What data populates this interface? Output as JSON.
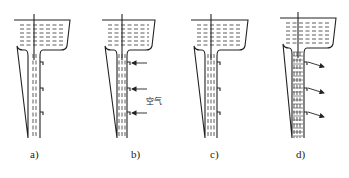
{
  "figure": {
    "panels": [
      {
        "id": "a",
        "label": "a)",
        "flow": "jet-contracted",
        "arrows": "none"
      },
      {
        "id": "b",
        "label": "b)",
        "flow": "aerated-suction",
        "arrows": "inward",
        "arrow_label": "空气"
      },
      {
        "id": "c",
        "label": "c)",
        "flow": "full-pipe",
        "arrows": "none"
      },
      {
        "id": "d",
        "label": "d)",
        "flow": "pressurized",
        "arrows": "outward"
      }
    ]
  },
  "colors": {
    "line": "#222222",
    "background": "#ffffff"
  }
}
